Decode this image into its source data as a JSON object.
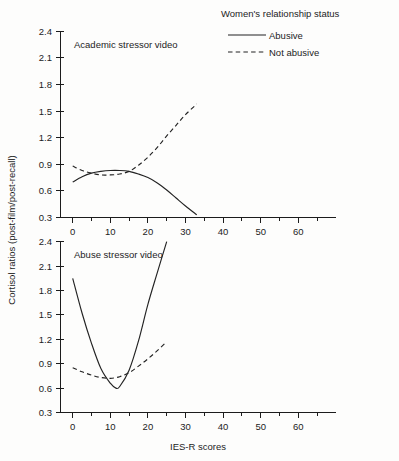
{
  "chart_data": [
    {
      "type": "line",
      "title": "Academic stressor video",
      "xlabel": "",
      "ylabel": "Cortisol ratios (post-film/post-recall)",
      "xlim": [
        -4,
        68
      ],
      "ylim": [
        0.3,
        2.4
      ],
      "grid": false,
      "x_ticks": [
        0,
        10,
        20,
        30,
        40,
        50,
        60
      ],
      "x_minor_ticks": [
        5,
        15,
        25,
        35,
        45,
        55,
        65
      ],
      "y_ticks": [
        0.3,
        0.6,
        0.9,
        1.2,
        1.5,
        1.8,
        2.1,
        2.4
      ],
      "series": [
        {
          "name": "Abusive",
          "style": "solid",
          "x": [
            0,
            5,
            10,
            15,
            20,
            25,
            30,
            35,
            40,
            45,
            50,
            55,
            60,
            66
          ],
          "values": [
            0.7,
            0.76,
            0.8,
            0.82,
            0.83,
            0.83,
            0.82,
            0.79,
            0.75,
            0.69,
            0.61,
            0.52,
            0.43,
            0.33
          ]
        },
        {
          "name": "Not abusive",
          "style": "dashed",
          "x": [
            0,
            5,
            10,
            15,
            20,
            25,
            30,
            35,
            40,
            45,
            50,
            55,
            60,
            66
          ],
          "values": [
            0.88,
            0.83,
            0.8,
            0.78,
            0.78,
            0.79,
            0.82,
            0.89,
            0.98,
            1.09,
            1.22,
            1.34,
            1.46,
            1.58
          ]
        }
      ]
    },
    {
      "type": "line",
      "title": "Abuse stressor video",
      "xlabel": "IES-R scores",
      "ylabel": "Cortisol ratios (post-film/post-recall)",
      "xlim": [
        -4,
        68
      ],
      "ylim": [
        0.3,
        2.4
      ],
      "grid": false,
      "x_ticks": [
        0,
        10,
        20,
        30,
        40,
        50,
        60
      ],
      "x_minor_ticks": [
        5,
        15,
        25,
        35,
        45,
        55,
        65
      ],
      "y_ticks": [
        0.3,
        0.6,
        0.9,
        1.2,
        1.5,
        1.8,
        2.1,
        2.4
      ],
      "series": [
        {
          "name": "Abusive",
          "style": "solid",
          "x": [
            0,
            5,
            10,
            15,
            20,
            23,
            25,
            30,
            35,
            40,
            45,
            50
          ],
          "values": [
            1.95,
            1.52,
            1.15,
            0.84,
            0.66,
            0.6,
            0.62,
            0.82,
            1.18,
            1.63,
            2.02,
            2.4
          ]
        },
        {
          "name": "Not abusive",
          "style": "dashed",
          "x": [
            0,
            5,
            10,
            15,
            20,
            25,
            30,
            35,
            40,
            45,
            50
          ],
          "values": [
            0.85,
            0.8,
            0.76,
            0.73,
            0.72,
            0.74,
            0.79,
            0.87,
            0.96,
            1.06,
            1.17
          ]
        }
      ]
    }
  ],
  "legend": {
    "title": "Women's relationship status",
    "position": "top-right",
    "entries": [
      {
        "label": "Abusive",
        "style": "solid"
      },
      {
        "label": "Not abusive",
        "style": "dashed"
      }
    ]
  },
  "axes": {
    "y_title": "Cortisol ratios (post-film/post-recall)",
    "x_title": "IES-R scores",
    "y_tick_labels": [
      "0.3",
      "0.6",
      "0.9",
      "1.2",
      "1.5",
      "1.8",
      "2.1",
      "2.4"
    ],
    "x_tick_labels": [
      "0",
      "10",
      "20",
      "30",
      "40",
      "50",
      "60"
    ]
  },
  "panels": {
    "top_title": "Academic stressor video",
    "bottom_title": "Abuse stressor video"
  },
  "colors": {
    "ink": "#232323",
    "background": "#fdfdfc"
  }
}
